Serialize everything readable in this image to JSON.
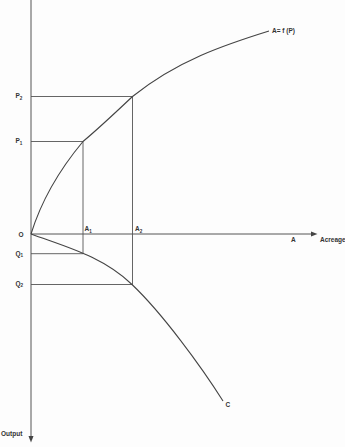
{
  "diagram": {
    "axes": {
      "x": {
        "label": "Acreage",
        "end_label": "A"
      },
      "y": {
        "label": "Output"
      },
      "origin": "O"
    },
    "curves": {
      "upper": {
        "label": "A= f (P)"
      },
      "lower": {
        "label": "C"
      }
    },
    "levels": {
      "P2": {
        "letter": "P",
        "sub": "2"
      },
      "P1": {
        "letter": "P",
        "sub": "1"
      },
      "Q1": {
        "letter": "Q",
        "sub": "1"
      },
      "Q2": {
        "letter": "Q",
        "sub": "2"
      },
      "A1": {
        "letter": "A",
        "sub": "1"
      },
      "A2": {
        "letter": "A",
        "sub": "2"
      }
    },
    "colors": {
      "line": "#444444",
      "text": "#333333",
      "background": "#fdfdfd"
    }
  }
}
